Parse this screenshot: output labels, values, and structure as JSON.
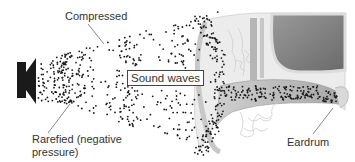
{
  "diagram": {
    "labels": {
      "compressed": "Compressed",
      "sound_waves": "Sound waves",
      "rarefied_line1": "Rarefied (negative",
      "rarefied_line2": "pressure)",
      "eardrum": "Eardrum"
    },
    "components": [
      "speaker",
      "sound-wave-particles",
      "outer-ear",
      "ear-canal",
      "eardrum"
    ],
    "colors": {
      "speaker": "#1a1a1a",
      "dots": "#1a1a1a",
      "ear_light": "#e6e6e6",
      "ear_mid": "#bdbdbd",
      "ear_dark": "#7a7a7a",
      "text": "#333333"
    }
  }
}
